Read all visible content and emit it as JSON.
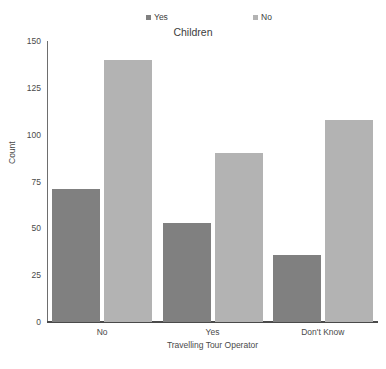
{
  "chart_data": {
    "type": "bar",
    "title": "Children",
    "xlabel": "Travelling Tour Operator",
    "ylabel": "Count",
    "categories": [
      "No",
      "Yes",
      "Don't Know"
    ],
    "series": [
      {
        "name": "Yes",
        "color": "#808080",
        "values": [
          71,
          53,
          36
        ]
      },
      {
        "name": "No",
        "color": "#b3b3b3",
        "values": [
          140,
          90,
          108
        ]
      }
    ],
    "ylim": [
      0,
      150
    ],
    "yticks": [
      0,
      25,
      50,
      75,
      100,
      125,
      150
    ],
    "grid": false,
    "legend_position": "top"
  }
}
